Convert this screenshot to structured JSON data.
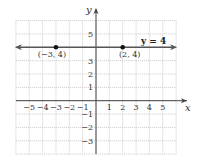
{
  "chart_data": {
    "type": "line",
    "title": "",
    "xlabel": "x",
    "ylabel": "y",
    "xlim": [
      -6,
      6
    ],
    "ylim": [
      -4,
      6
    ],
    "grid": true,
    "x_ticks": [
      -5,
      -4,
      -3,
      -2,
      -1,
      1,
      2,
      3,
      4,
      5
    ],
    "y_ticks": [
      -3,
      -2,
      -1,
      1,
      2,
      3,
      5
    ],
    "x_tick_labels": [
      "−5",
      "−4",
      "−3",
      "−2",
      "−1",
      "1",
      "2",
      "3",
      "4",
      "5"
    ],
    "y_tick_labels": [
      "−3",
      "−2",
      "−1",
      "1",
      "2",
      "3",
      "5"
    ],
    "series": [
      {
        "name": "y = 4",
        "type": "horizontal-line",
        "y": 4,
        "arrows": "both",
        "color": "#555555"
      }
    ],
    "points": [
      {
        "x": -3,
        "y": 4,
        "label": "(−3, 4)"
      },
      {
        "x": 2,
        "y": 4,
        "label": "(2, 4)"
      }
    ],
    "annotations": [
      {
        "text": "y = 4",
        "x": 4.2,
        "y": 4.3
      }
    ]
  },
  "colors": {
    "grid": "#c8c8c8",
    "axis": "#444444",
    "line": "#555555",
    "point": "#111111"
  }
}
